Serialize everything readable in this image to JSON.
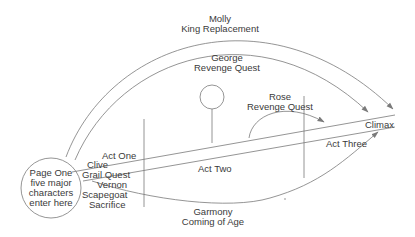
{
  "diagram": {
    "type": "story-structure",
    "line_color": "#7a7a7a",
    "text_color": "#3a3a3a",
    "start_node": {
      "lines": [
        "Page One",
        "five major",
        "characters",
        "enter here"
      ]
    },
    "acts": {
      "one": "Act One",
      "two": "Act Two",
      "three": "Act Three"
    },
    "end_node": "Climax",
    "threads": [
      {
        "character": "Molly",
        "arc": "King Replacement"
      },
      {
        "character": "George",
        "arc": "Revenge Quest"
      },
      {
        "character": "Rose",
        "arc": "Revenge Quest"
      },
      {
        "character": "Clive",
        "arc": "Grail Quest"
      },
      {
        "character": "Vernon",
        "arc": "Scapegoat Sacrifice",
        "arc_lines": [
          "Scapegoat",
          "Sacrifice"
        ]
      },
      {
        "character": "Garmony",
        "arc": "Coming of Age"
      }
    ]
  }
}
